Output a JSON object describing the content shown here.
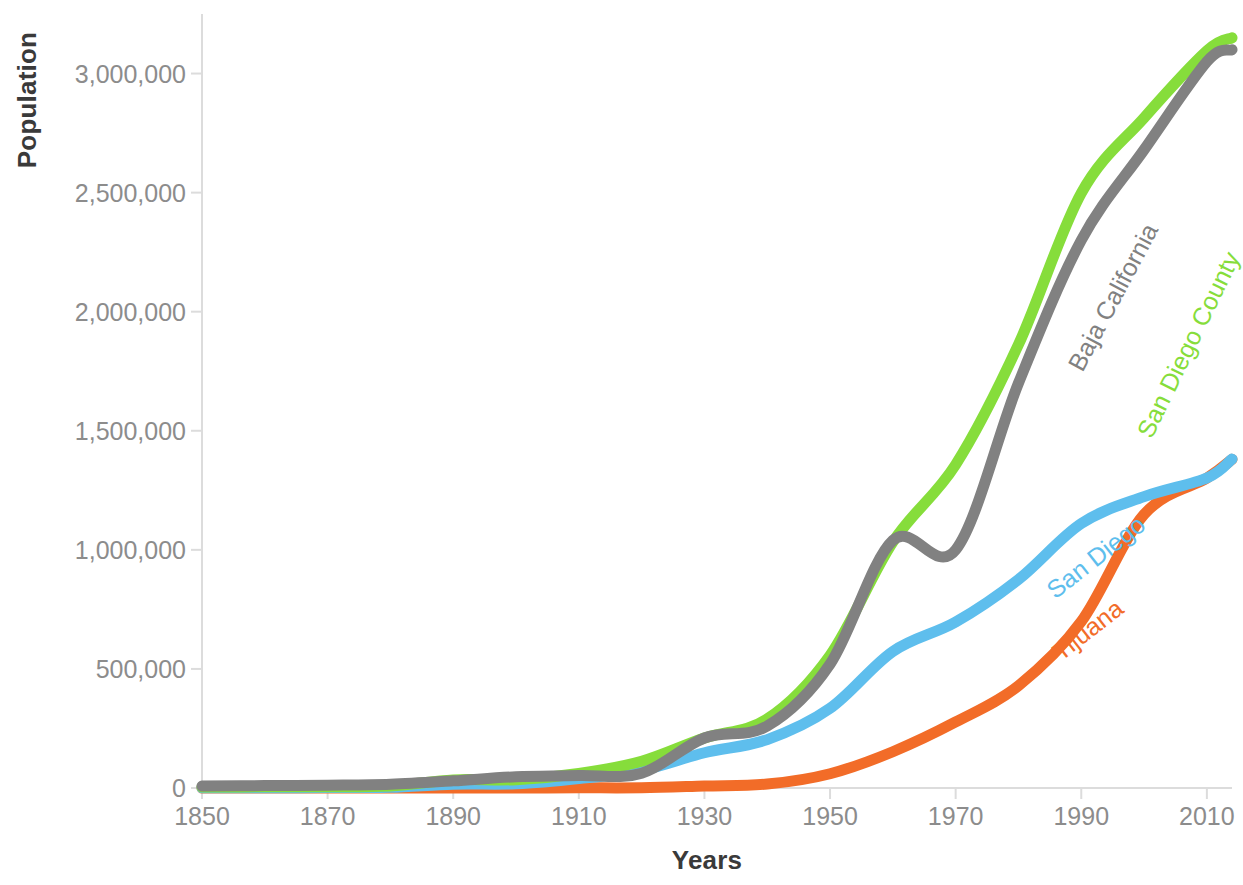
{
  "chart_data": {
    "type": "line",
    "title": "",
    "xlabel": "Years",
    "ylabel": "Population",
    "xlim": [
      1850,
      2014
    ],
    "ylim": [
      0,
      3250000
    ],
    "grid": false,
    "legend_position": "inline-labels-on-series",
    "x_ticks": [
      1850,
      1870,
      1890,
      1910,
      1930,
      1950,
      1970,
      1990,
      2010
    ],
    "x_tick_labels": [
      "1850",
      "1870",
      "1890",
      "1910",
      "1930",
      "1950",
      "1970",
      "1990",
      "2010"
    ],
    "y_ticks": [
      0,
      500000,
      1000000,
      1500000,
      2000000,
      2500000,
      3000000
    ],
    "y_tick_labels": [
      "0",
      "500,000",
      "1,000,000",
      "1,500,000",
      "2,000,000",
      "2,500,000",
      "3,000,000"
    ],
    "x": [
      1850,
      1860,
      1870,
      1880,
      1890,
      1900,
      1910,
      1920,
      1930,
      1940,
      1950,
      1960,
      1970,
      1980,
      1990,
      2000,
      2010,
      2014
    ],
    "series": [
      {
        "name": "Baja California",
        "color": "#818181",
        "label": "Baja California",
        "label_angle": -62,
        "label_x": 1989,
        "label_y": 1760000,
        "values": [
          8000,
          10000,
          12000,
          16000,
          30000,
          47000,
          52000,
          62000,
          210000,
          260000,
          520000,
          1040000,
          1000000,
          1700000,
          2300000,
          2680000,
          3050000,
          3100000
        ]
      },
      {
        "name": "San Diego County",
        "color": "#86DD3B",
        "label": "San Diego County",
        "label_angle": -64,
        "label_x": 2000,
        "label_y": 1480000,
        "values": [
          4300,
          4900,
          5000,
          8600,
          34000,
          35000,
          61000,
          112000,
          210000,
          290000,
          557000,
          1033000,
          1358000,
          1862000,
          2498000,
          2814000,
          3095000,
          3150000
        ]
      },
      {
        "name": "San Diego",
        "color": "#5EBEED",
        "label": "San Diego",
        "label_angle": -38,
        "label_x": 1985,
        "label_y": 820000,
        "values": [
          650,
          731,
          2300,
          2637,
          16159,
          17700,
          39578,
          74361,
          147995,
          203341,
          334387,
          573224,
          696769,
          875538,
          1110549,
          1223400,
          1301617,
          1381069
        ]
      },
      {
        "name": "Tijuana",
        "color": "#F26C28",
        "label": "Tijuana",
        "label_angle": -38,
        "label_x": 1986,
        "label_y": 560000,
        "values": [
          0,
          0,
          0,
          0,
          242,
          242,
          733,
          1028,
          8384,
          16486,
          59952,
          152374,
          277306,
          429500,
          698752,
          1148681,
          1300983,
          1380000
        ]
      }
    ]
  },
  "axis": {
    "y_title": "Population",
    "x_title": "Years"
  }
}
